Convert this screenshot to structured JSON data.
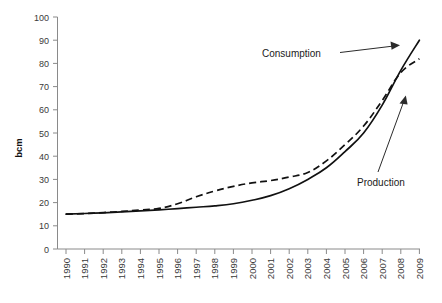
{
  "chart_data": {
    "type": "line",
    "title": "",
    "subtitle": "",
    "xlabel": "",
    "ylabel": "bcm",
    "ylim": [
      0,
      100
    ],
    "ytick_step": 10,
    "yticks": [
      0,
      10,
      20,
      30,
      40,
      50,
      60,
      70,
      80,
      90,
      100
    ],
    "grid": false,
    "legend_position": "inline-annotations",
    "x": [
      1990,
      1991,
      1992,
      1993,
      1994,
      1995,
      1996,
      1997,
      1998,
      1999,
      2000,
      2001,
      2002,
      2003,
      2004,
      2005,
      2006,
      2007,
      2008,
      2009
    ],
    "categories": [
      "1990",
      "1991",
      "1992",
      "1993",
      "1994",
      "1995",
      "1996",
      "1997",
      "1998",
      "1999",
      "2000",
      "2001",
      "2002",
      "2003",
      "2004",
      "2005",
      "2006",
      "2007",
      "2008",
      "2009"
    ],
    "series": [
      {
        "name": "Consumption",
        "style": "solid",
        "color": "#111111",
        "values": [
          15,
          15.3,
          15.6,
          16,
          16.4,
          16.9,
          17.4,
          18,
          18.6,
          19.5,
          21,
          23,
          26,
          30,
          35,
          42,
          50,
          62,
          77,
          90
        ]
      },
      {
        "name": "Production",
        "style": "dashed",
        "color": "#111111",
        "values": [
          15,
          15.3,
          15.7,
          16.2,
          16.8,
          17.5,
          19.5,
          22.5,
          25,
          27,
          28.5,
          29.5,
          31,
          33,
          38,
          45,
          53,
          64,
          76,
          82
        ]
      }
    ],
    "annotations": [
      {
        "text": "Consumption",
        "target_series": "Consumption",
        "target_x": 2009
      },
      {
        "text": "Production",
        "target_series": "Production",
        "target_x": 2008
      }
    ]
  },
  "axes": {
    "y_axis_title": "bcm",
    "y_tick_labels": [
      "100",
      "90",
      "80",
      "70",
      "60",
      "50",
      "40",
      "30",
      "20",
      "10",
      "0"
    ],
    "x_tick_labels": [
      "1990",
      "1991",
      "1992",
      "1993",
      "1994",
      "1995",
      "1996",
      "1997",
      "1998",
      "1999",
      "2000",
      "2001",
      "2002",
      "2003",
      "2004",
      "2005",
      "2006",
      "2007",
      "2008",
      "2009"
    ]
  },
  "annotations": {
    "consumption_label": "Consumption",
    "production_label": "Production"
  },
  "colors": {
    "line": "#111111",
    "axis": "#8a8a8a",
    "text": "#3a3a3a",
    "background": "#ffffff"
  }
}
